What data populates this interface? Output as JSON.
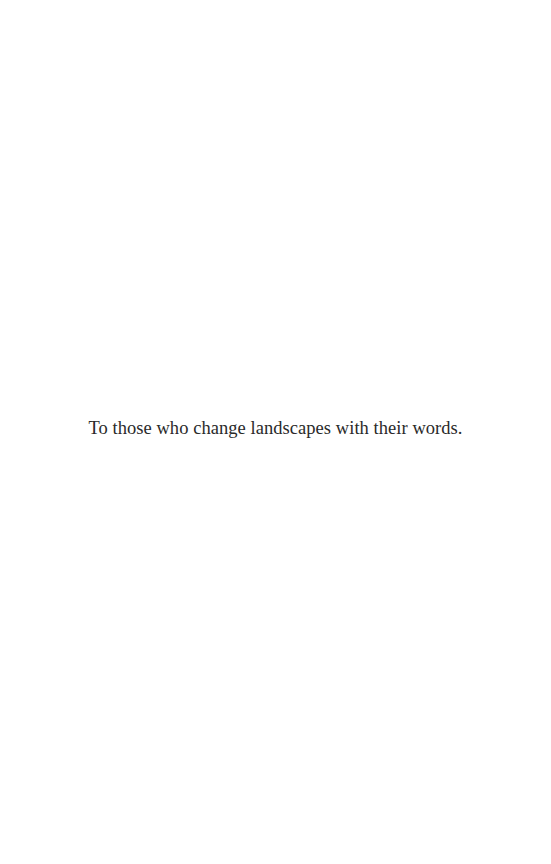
{
  "page": {
    "type": "dedication",
    "dedication_text": "To those who change landscapes with their words."
  },
  "colors": {
    "background": "#ffffff",
    "text": "#2a2a2a"
  }
}
